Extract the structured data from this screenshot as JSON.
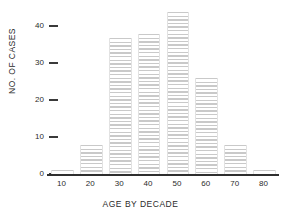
{
  "chart_data": {
    "type": "bar",
    "title": "",
    "xlabel": "AGE BY DECADE",
    "ylabel": "NO. OF CASES",
    "categories": [
      "10",
      "20",
      "30",
      "40",
      "50",
      "60",
      "70",
      "80"
    ],
    "values": [
      1,
      8,
      37,
      38,
      44,
      26,
      8,
      1
    ],
    "series": [
      {
        "name": "No. of cases",
        "values": [
          1,
          8,
          37,
          38,
          44,
          26,
          8,
          1
        ]
      }
    ],
    "ylim": [
      0,
      45
    ],
    "y_ticks": [
      "0",
      "10",
      "20",
      "30",
      "40"
    ],
    "y_tick_values": [
      0,
      10,
      20,
      30,
      40
    ],
    "x_ticks": [
      "10",
      "20",
      "30",
      "40",
      "50",
      "60",
      "70",
      "80"
    ],
    "grid": false,
    "legend": "none",
    "bar_fill": "#c9c9c9",
    "bar_pattern": "horizontal-hatch",
    "axis_color": "#2f2f2f",
    "text_color": "#2b2b2b",
    "background": "#ffffff"
  }
}
